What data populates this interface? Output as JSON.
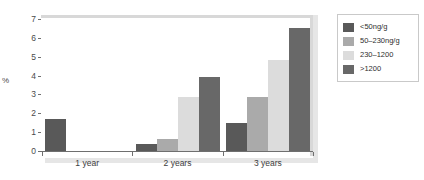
{
  "chart_data": {
    "type": "bar",
    "title": "",
    "xlabel": "",
    "ylabel": "%",
    "ylim": [
      0,
      7
    ],
    "ytick_labels": [
      "7",
      "6",
      "5",
      "4",
      "3",
      "2",
      "1",
      "0"
    ],
    "ytick_values": [
      7,
      6,
      5,
      4,
      3,
      2,
      1,
      0
    ],
    "grid": false,
    "legend_position": "right",
    "categories": [
      "1 year",
      "2 years",
      "3 years"
    ],
    "series": [
      {
        "name": "<50ng/g",
        "color": "#595959",
        "values": [
          1.7,
          0.35,
          1.5
        ]
      },
      {
        "name": "50–230ng/g",
        "color": "#aaaaaa",
        "values": [
          0,
          0.65,
          2.85
        ]
      },
      {
        "name": "230–1200",
        "color": "#dcdcdc",
        "values": [
          0,
          2.85,
          4.85
        ]
      },
      {
        "name": ">1200",
        "color": "#686868",
        "values": [
          0,
          3.95,
          6.55
        ]
      }
    ]
  },
  "colors": {
    "axis": "#6f6f6f",
    "text": "#3d3d3d",
    "frame": "#d8d8d8",
    "shadow": "#e6e6e6",
    "background": "#ffffff"
  }
}
